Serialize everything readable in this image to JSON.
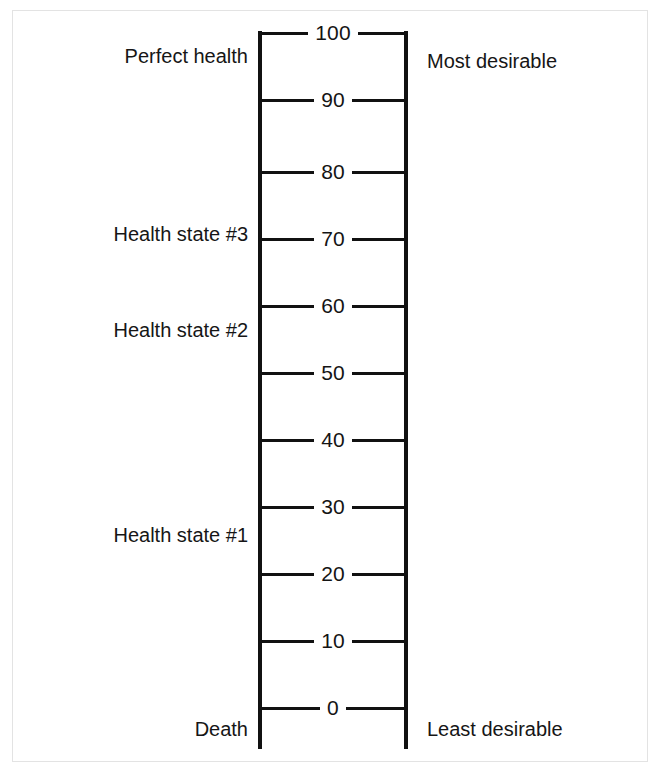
{
  "figure": {
    "type": "visual-analogue-scale",
    "background_color": "#ffffff",
    "line_color": "#111111",
    "text_color": "#161616",
    "border_color": "#e3e3e3"
  },
  "scale": {
    "min": 0,
    "max": 100,
    "step": 10,
    "orientation": "vertical",
    "top_y": 33,
    "bottom_y": 708,
    "ticks": [
      {
        "value": 100,
        "label": "100",
        "y": 33
      },
      {
        "value": 90,
        "label": "90",
        "y": 100
      },
      {
        "value": 80,
        "label": "80",
        "y": 172
      },
      {
        "value": 70,
        "label": "70",
        "y": 239
      },
      {
        "value": 60,
        "label": "60",
        "y": 306
      },
      {
        "value": 50,
        "label": "50",
        "y": 373
      },
      {
        "value": 40,
        "label": "40",
        "y": 440
      },
      {
        "value": 30,
        "label": "30",
        "y": 507
      },
      {
        "value": 20,
        "label": "20",
        "y": 574
      },
      {
        "value": 10,
        "label": "10",
        "y": 641
      },
      {
        "value": 0,
        "label": "0",
        "y": 708
      }
    ]
  },
  "annotations": {
    "left": [
      {
        "text": "Perfect health",
        "value": 100,
        "y": 56
      },
      {
        "text": "Health state #3",
        "value": 70,
        "y": 234
      },
      {
        "text": "Health state #2",
        "value": 56,
        "y": 330
      },
      {
        "text": "Health state #1",
        "value": 26,
        "y": 535
      },
      {
        "text": "Death",
        "value": 0,
        "y": 729
      }
    ],
    "right": [
      {
        "text": "Most desirable",
        "value": 100,
        "y": 61
      },
      {
        "text": "Least desirable",
        "value": 0,
        "y": 729
      }
    ]
  },
  "chart_data": {
    "type": "scatter",
    "xlabel": "",
    "ylabel": "",
    "ylim": [
      0,
      100
    ],
    "grid": false,
    "legend": "none",
    "categories": [
      "Perfect health",
      "Health state #3",
      "Health state #2",
      "Health state #1",
      "Death"
    ],
    "values": [
      100,
      70,
      56,
      26,
      0
    ],
    "tick_labels": [
      "100",
      "90",
      "80",
      "70",
      "60",
      "50",
      "40",
      "30",
      "20",
      "10",
      "0"
    ],
    "annotations": [
      "Most desirable",
      "Least desirable"
    ]
  }
}
